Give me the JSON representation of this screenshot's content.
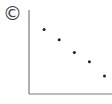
{
  "panel_label": "©",
  "colors": {
    "axis": "#7a7a7a",
    "point": "#222222",
    "label": "#444444"
  },
  "chart_data": {
    "type": "scatter",
    "title": "",
    "xlabel": "",
    "ylabel": "",
    "x": [
      1,
      2,
      3,
      4,
      5
    ],
    "y": [
      5,
      4.2,
      3.2,
      2.5,
      1.4
    ],
    "xlim": [
      0,
      5.5
    ],
    "ylim": [
      0,
      6.5
    ],
    "grid": false,
    "legend": "none",
    "ticks": "none"
  }
}
